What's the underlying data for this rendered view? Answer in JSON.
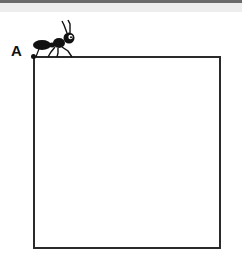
{
  "diagram": {
    "vertex_label": "A",
    "shape": "square",
    "figure": "ant-on-square-corner",
    "colors": {
      "stroke": "#2a2a2a",
      "ant": "#111111",
      "background": "#ffffff",
      "top_bar": "#6a6a6a",
      "top_band": "#ededed"
    }
  }
}
